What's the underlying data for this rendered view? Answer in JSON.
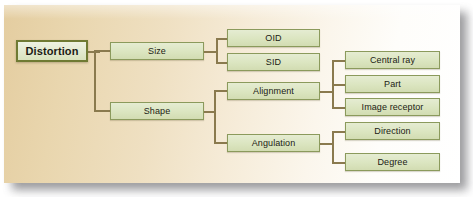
{
  "diagram": {
    "title": "Distortion",
    "type": "hierarchy-tree",
    "colors": {
      "node_fill": "#dbe5c0",
      "node_border": "#8b9a5c",
      "root_border": "#6f7a33",
      "connector": "#8a7a4e",
      "background_left": "#e4cda0",
      "background_right": "#ffffff"
    },
    "nodes": {
      "root": "Distortion",
      "level1": [
        {
          "label": "Size"
        },
        {
          "label": "Shape"
        }
      ],
      "level2": [
        {
          "label": "OID"
        },
        {
          "label": "SID"
        },
        {
          "label": "Alignment"
        },
        {
          "label": "Angulation"
        }
      ],
      "level3": [
        {
          "label": "Central ray"
        },
        {
          "label": "Part"
        },
        {
          "label": "Image receptor"
        },
        {
          "label": "Direction"
        },
        {
          "label": "Degree"
        }
      ]
    }
  }
}
